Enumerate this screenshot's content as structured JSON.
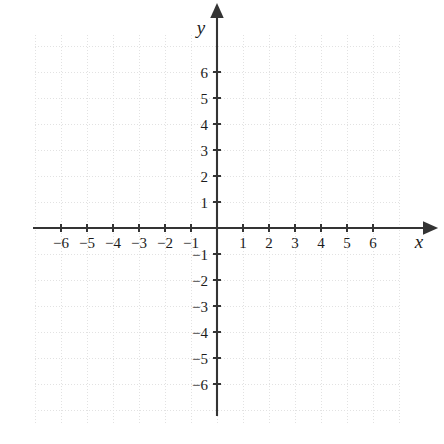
{
  "figure": {
    "title": "",
    "width": 444,
    "height": 444,
    "background_color": "#ffffff",
    "axis_color": "#343434",
    "grid_color": "#e2e2e2",
    "label_color": "#1c1c1c"
  },
  "axis_labels": {
    "x": "x",
    "y": "y"
  },
  "chart_data": {
    "type": "scatter",
    "title": "",
    "xlabel": "x",
    "ylabel": "y",
    "xlim": [
      -7,
      7
    ],
    "ylim": [
      -7,
      7
    ],
    "grid": true,
    "grid_step": 1,
    "legend": "none",
    "origin_label": "",
    "x_ticks": [
      -6,
      -5,
      -4,
      -3,
      -2,
      -1,
      1,
      2,
      3,
      4,
      5,
      6
    ],
    "y_ticks": [
      -6,
      -5,
      -4,
      -3,
      -2,
      -1,
      1,
      2,
      3,
      4,
      5,
      6
    ],
    "x_tick_labels": [
      "−6",
      "−5",
      "−4",
      "−3",
      "−2",
      "−1",
      "1",
      "2",
      "3",
      "4",
      "5",
      "6"
    ],
    "y_tick_labels": [
      "−6",
      "−5",
      "−4",
      "−3",
      "−2",
      "−1",
      "1",
      "2",
      "3",
      "4",
      "5",
      "6"
    ],
    "series": [],
    "x": [],
    "values": [],
    "annotations": []
  },
  "geometry": {
    "origin_x": 217,
    "origin_y": 228,
    "unit_px": 26,
    "tick_half_len": 4,
    "x_axis_start": 33,
    "x_axis_end": 423,
    "y_axis_start": 18,
    "y_axis_end": 416,
    "grid_left": 35,
    "grid_right": 401,
    "grid_top": 35,
    "grid_bottom": 425
  }
}
